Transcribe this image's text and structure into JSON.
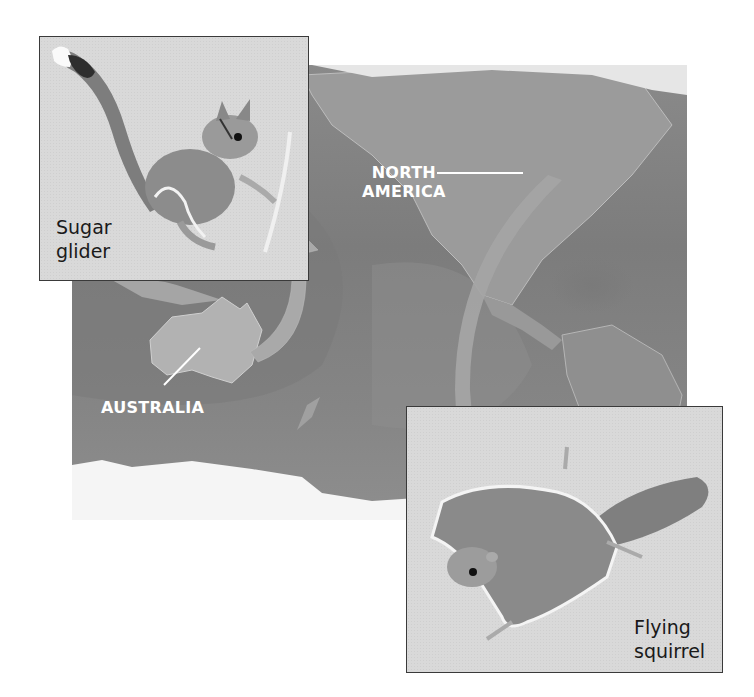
{
  "map": {
    "labels": {
      "north_america_line1": "NORTH",
      "north_america_line2": "AMERICA",
      "australia": "AUSTRALIA"
    },
    "colors": {
      "ocean": "#808080",
      "land": "#9a9a9a",
      "ice": "#f4f4f4",
      "arrow": "#a8a8a8",
      "label_text": "#ffffff"
    }
  },
  "insets": {
    "sugar_glider": {
      "label_line1": "Sugar",
      "label_line2": "glider"
    },
    "flying_squirrel": {
      "label_line1": "Flying",
      "label_line2": "squirrel"
    }
  },
  "arrows": [
    {
      "from": "australia",
      "to": "sugar_glider"
    },
    {
      "from": "north_america",
      "to": "flying_squirrel"
    }
  ]
}
